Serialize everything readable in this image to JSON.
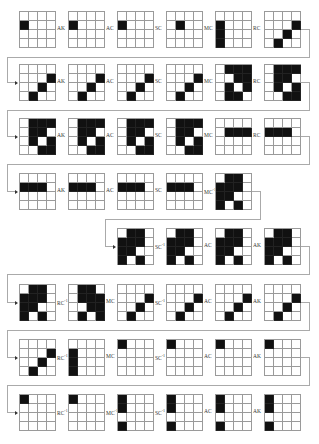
{
  "diagram": {
    "grid_size": 4,
    "colors": {
      "filled": "#111111",
      "empty": "#ffffff",
      "gridline": "#9a9a9a",
      "connector": "#aaaaaa"
    },
    "rows": [
      {
        "x0": 19,
        "y": 11,
        "items": [
          {
            "cells": [
              [
                2,
                1
              ]
            ],
            "label": "AK"
          },
          {
            "cells": [
              [
                2,
                1
              ]
            ],
            "label": "AC"
          },
          {
            "cells": [
              [
                2,
                1
              ]
            ],
            "label": "SC"
          },
          {
            "cells": [
              [
                2,
                2
              ]
            ],
            "label": "MC"
          },
          {
            "cells": [
              [
                2,
                1
              ],
              [
                3,
                1
              ],
              [
                4,
                1
              ]
            ],
            "label": "RC"
          },
          {
            "cells": [
              [
                2,
                4
              ],
              [
                3,
                3
              ],
              [
                4,
                2
              ]
            ],
            "label": ""
          }
        ]
      },
      {
        "x0": 19,
        "y": 64,
        "items": [
          {
            "cells": [
              [
                2,
                4
              ],
              [
                3,
                3
              ],
              [
                4,
                2
              ]
            ],
            "label": "AK"
          },
          {
            "cells": [
              [
                2,
                4
              ],
              [
                3,
                3
              ],
              [
                4,
                2
              ]
            ],
            "label": "AC"
          },
          {
            "cells": [
              [
                2,
                4
              ],
              [
                3,
                3
              ],
              [
                4,
                2
              ]
            ],
            "label": "SC"
          },
          {
            "cells": [
              [
                2,
                4
              ],
              [
                3,
                3
              ],
              [
                4,
                2
              ]
            ],
            "label": "MC"
          },
          {
            "cells": [
              [
                1,
                2
              ],
              [
                1,
                3
              ],
              [
                1,
                4
              ],
              [
                2,
                3
              ],
              [
                2,
                4
              ],
              [
                3,
                2
              ],
              [
                3,
                4
              ],
              [
                4,
                2
              ],
              [
                4,
                3
              ]
            ],
            "label": "RC"
          },
          {
            "cells": [
              [
                1,
                2
              ],
              [
                1,
                3
              ],
              [
                1,
                4
              ],
              [
                2,
                2
              ],
              [
                2,
                3
              ],
              [
                3,
                2
              ],
              [
                3,
                4
              ],
              [
                4,
                3
              ],
              [
                4,
                4
              ]
            ],
            "label": ""
          }
        ]
      },
      {
        "x0": 19,
        "y": 118,
        "items": [
          {
            "cells": [
              [
                1,
                2
              ],
              [
                1,
                3
              ],
              [
                1,
                4
              ],
              [
                2,
                2
              ],
              [
                2,
                3
              ],
              [
                3,
                2
              ],
              [
                3,
                4
              ],
              [
                4,
                3
              ],
              [
                4,
                4
              ]
            ],
            "label": "AK"
          },
          {
            "cells": [
              [
                1,
                2
              ],
              [
                1,
                3
              ],
              [
                1,
                4
              ],
              [
                2,
                2
              ],
              [
                2,
                3
              ],
              [
                3,
                2
              ],
              [
                3,
                4
              ],
              [
                4,
                3
              ],
              [
                4,
                4
              ]
            ],
            "label": "AC"
          },
          {
            "cells": [
              [
                1,
                2
              ],
              [
                1,
                3
              ],
              [
                1,
                4
              ],
              [
                2,
                2
              ],
              [
                2,
                3
              ],
              [
                3,
                2
              ],
              [
                3,
                4
              ],
              [
                4,
                3
              ],
              [
                4,
                4
              ]
            ],
            "label": "SC"
          },
          {
            "cells": [
              [
                1,
                2
              ],
              [
                1,
                3
              ],
              [
                1,
                4
              ],
              [
                2,
                2
              ],
              [
                2,
                3
              ],
              [
                3,
                2
              ],
              [
                3,
                4
              ],
              [
                4,
                3
              ],
              [
                4,
                4
              ]
            ],
            "label": "MC"
          },
          {
            "cells": [
              [
                2,
                2
              ],
              [
                2,
                3
              ],
              [
                2,
                4
              ]
            ],
            "label": "RC"
          },
          {
            "cells": [
              [
                2,
                1
              ],
              [
                2,
                2
              ],
              [
                2,
                3
              ]
            ],
            "label": ""
          }
        ]
      },
      {
        "x0": 19,
        "y": 173,
        "items": [
          {
            "cells": [
              [
                2,
                1
              ],
              [
                2,
                2
              ],
              [
                2,
                3
              ]
            ],
            "label": "AK"
          },
          {
            "cells": [
              [
                2,
                1
              ],
              [
                2,
                2
              ],
              [
                2,
                3
              ]
            ],
            "label": "AC"
          },
          {
            "cells": [
              [
                2,
                1
              ],
              [
                2,
                2
              ],
              [
                2,
                3
              ]
            ],
            "label": "SC"
          },
          {
            "cells": [
              [
                2,
                1
              ],
              [
                2,
                2
              ],
              [
                2,
                3
              ]
            ],
            "label": "MC",
            "sup": "-1"
          },
          {
            "cells": [
              [
                1,
                2
              ],
              [
                1,
                3
              ],
              [
                2,
                1
              ],
              [
                2,
                2
              ],
              [
                2,
                3
              ],
              [
                3,
                1
              ],
              [
                3,
                2
              ],
              [
                4,
                1
              ],
              [
                4,
                3
              ]
            ],
            "label": ""
          }
        ]
      },
      {
        "x0": 117,
        "y": 228,
        "items": [
          {
            "cells": [
              [
                1,
                2
              ],
              [
                1,
                3
              ],
              [
                2,
                1
              ],
              [
                2,
                2
              ],
              [
                2,
                3
              ],
              [
                3,
                1
              ],
              [
                3,
                2
              ],
              [
                4,
                1
              ],
              [
                4,
                3
              ]
            ],
            "label": "SC",
            "sup": "-1"
          },
          {
            "cells": [
              [
                1,
                2
              ],
              [
                1,
                3
              ],
              [
                2,
                1
              ],
              [
                2,
                2
              ],
              [
                2,
                3
              ],
              [
                3,
                1
              ],
              [
                3,
                2
              ],
              [
                4,
                1
              ],
              [
                4,
                3
              ]
            ],
            "label": "AC"
          },
          {
            "cells": [
              [
                1,
                2
              ],
              [
                1,
                3
              ],
              [
                2,
                1
              ],
              [
                2,
                2
              ],
              [
                2,
                3
              ],
              [
                3,
                1
              ],
              [
                3,
                2
              ],
              [
                4,
                1
              ],
              [
                4,
                3
              ]
            ],
            "label": "AK"
          },
          {
            "cells": [
              [
                1,
                2
              ],
              [
                1,
                3
              ],
              [
                2,
                1
              ],
              [
                2,
                2
              ],
              [
                2,
                3
              ],
              [
                3,
                1
              ],
              [
                3,
                2
              ],
              [
                4,
                1
              ],
              [
                4,
                3
              ]
            ],
            "label": ""
          }
        ]
      },
      {
        "x0": 19,
        "y": 284,
        "items": [
          {
            "cells": [
              [
                1,
                2
              ],
              [
                1,
                3
              ],
              [
                2,
                1
              ],
              [
                2,
                2
              ],
              [
                2,
                3
              ],
              [
                3,
                1
              ],
              [
                3,
                2
              ],
              [
                4,
                1
              ],
              [
                4,
                3
              ]
            ],
            "label": "RC",
            "sup": "-1"
          },
          {
            "cells": [
              [
                1,
                2
              ],
              [
                1,
                3
              ],
              [
                2,
                2
              ],
              [
                2,
                3
              ],
              [
                2,
                4
              ],
              [
                3,
                3
              ],
              [
                3,
                4
              ],
              [
                4,
                2
              ],
              [
                4,
                4
              ]
            ],
            "label": "MC"
          },
          {
            "cells": [
              [
                2,
                4
              ],
              [
                3,
                3
              ],
              [
                4,
                2
              ]
            ],
            "label": "SC",
            "sup": "-1"
          },
          {
            "cells": [
              [
                2,
                4
              ],
              [
                3,
                3
              ],
              [
                4,
                2
              ]
            ],
            "label": "AC"
          },
          {
            "cells": [
              [
                2,
                4
              ],
              [
                3,
                3
              ],
              [
                4,
                2
              ]
            ],
            "label": "AK"
          },
          {
            "cells": [
              [
                2,
                4
              ],
              [
                3,
                3
              ],
              [
                4,
                2
              ]
            ],
            "label": ""
          }
        ]
      },
      {
        "x0": 19,
        "y": 339,
        "items": [
          {
            "cells": [
              [
                2,
                4
              ],
              [
                3,
                3
              ],
              [
                4,
                2
              ]
            ],
            "label": "RC",
            "sup": "-1"
          },
          {
            "cells": [
              [
                2,
                1
              ],
              [
                3,
                1
              ],
              [
                4,
                1
              ]
            ],
            "label": "MC"
          },
          {
            "cells": [
              [
                1,
                1
              ]
            ],
            "label": "SC",
            "sup": "-1"
          },
          {
            "cells": [
              [
                1,
                1
              ]
            ],
            "label": "AC"
          },
          {
            "cells": [
              [
                1,
                1
              ]
            ],
            "label": "AK"
          },
          {
            "cells": [
              [
                1,
                1
              ]
            ],
            "label": ""
          }
        ]
      },
      {
        "x0": 19,
        "y": 394,
        "items": [
          {
            "cells": [
              [
                1,
                1
              ]
            ],
            "label": "RC",
            "sup": "-1"
          },
          {
            "cells": [
              [
                1,
                1
              ]
            ],
            "label": "MC",
            "sup": "-1"
          },
          {
            "cells": [
              [
                1,
                1
              ],
              [
                2,
                1
              ],
              [
                4,
                1
              ]
            ],
            "label": "SC",
            "sup": "-1"
          },
          {
            "cells": [
              [
                1,
                1
              ],
              [
                2,
                1
              ],
              [
                4,
                1
              ]
            ],
            "label": "AC"
          },
          {
            "cells": [
              [
                1,
                1
              ],
              [
                2,
                1
              ],
              [
                4,
                1
              ]
            ],
            "label": "AK"
          },
          {
            "cells": [
              [
                1,
                1
              ],
              [
                2,
                1
              ],
              [
                4,
                1
              ]
            ],
            "label": ""
          }
        ]
      }
    ]
  }
}
